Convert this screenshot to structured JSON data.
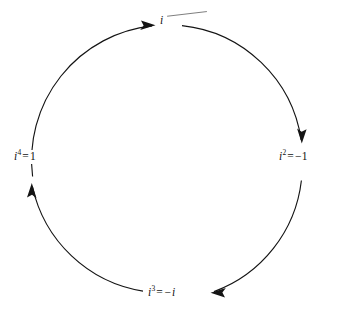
{
  "figure": {
    "kind": "cycle-diagram",
    "background_color": "#ffffff",
    "stroke_color": "#141414",
    "text_color": "#111111",
    "direction": "clockwise"
  },
  "geometry": {
    "center_x": 167,
    "center_y": 160,
    "radius": 135
  },
  "nodes": [
    {
      "id": "power-1",
      "position": "top",
      "base": "i",
      "exponent": "",
      "operator": "",
      "result": "",
      "full_text": "i"
    },
    {
      "id": "power-2",
      "position": "right",
      "base": "i",
      "exponent": "2",
      "operator": "=",
      "result": "−1",
      "full_text": "i² = −1"
    },
    {
      "id": "power-3",
      "position": "bottom",
      "base": "i",
      "exponent": "3",
      "operator": "=",
      "result": "−i",
      "full_text": "i³ = −i"
    },
    {
      "id": "power-4",
      "position": "left",
      "base": "i",
      "exponent": "4",
      "operator": "=",
      "result": "1",
      "full_text": "i⁴ = 1"
    }
  ],
  "arcs": [
    {
      "id": "arc-left-to-top",
      "from": "power-4",
      "to": "power-1",
      "arrow_at": "top",
      "arrow_direction": "right"
    },
    {
      "id": "arc-top-to-right",
      "from": "power-1",
      "to": "power-2",
      "arrow_at": "right",
      "arrow_direction": "down"
    },
    {
      "id": "arc-right-to-bottom",
      "from": "power-2",
      "to": "power-3",
      "arrow_at": "bottom",
      "arrow_direction": "left"
    },
    {
      "id": "arc-bottom-to-left",
      "from": "power-3",
      "to": "power-4",
      "arrow_at": "left",
      "arrow_direction": "up"
    }
  ]
}
